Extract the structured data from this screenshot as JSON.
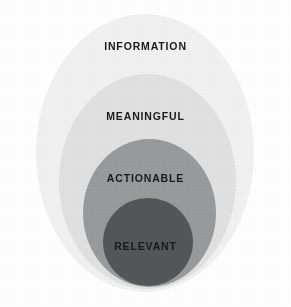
{
  "diagram": {
    "type": "nested-circles",
    "background_color": "#ffffff",
    "layers": [
      {
        "id": "information",
        "label": "INFORMATION",
        "level": 1,
        "fill_color": "#f1f1f1",
        "text_color": "#1a1a1a"
      },
      {
        "id": "meaningful",
        "label": "MEANINGFUL",
        "level": 2,
        "fill_color": "#e1e1e1",
        "text_color": "#1a1a1a"
      },
      {
        "id": "actionable",
        "label": "ACTIONABLE",
        "level": 3,
        "fill_color": "#999a9b",
        "text_color": "#1a1a1a"
      },
      {
        "id": "relevant",
        "label": "RELEVANT",
        "level": 4,
        "fill_color": "#55565a",
        "text_color": "#1a1a1a"
      }
    ]
  }
}
